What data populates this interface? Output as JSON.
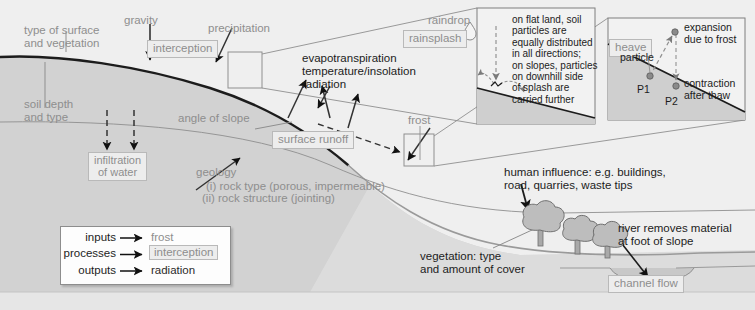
{
  "colors": {
    "sky": "#efefef",
    "ground": "#cfcfcf",
    "ground_light": "#dcdcdc",
    "inset_fill": "#f2f2f2",
    "inset_ground": "#d2d2d2",
    "input_text": "#8e8e8e",
    "output_text": "#2b2b2b",
    "box_border": "#b9b9b9",
    "box_fill": "#ededed",
    "line": "#6e6e6e",
    "slope_line": "#1c1c1c"
  },
  "labels": {
    "type_of_surface": "type of surface\nand vegetation",
    "gravity": "gravity",
    "interception": "interception",
    "precipitation": "precipitation",
    "soil_depth": "soil depth\nand type",
    "infiltration": "infiltration\nof water",
    "angle_of_slope": "angle of slope",
    "evapotranspiration": "evapotranspiration\ntemperature/insolation\nradiation",
    "surface_runoff": "surface runoff",
    "geology": "geology",
    "geology_i": "(i) rock type (porous, impermeable)",
    "geology_ii": "(ii) rock structure (jointing)",
    "frost": "frost",
    "raindrop": "raindrop",
    "rainsplash": "rainsplash",
    "heave": "heave",
    "human_influence": "human influence: e.g. buildings,\nroad, quarries, waste tips",
    "vegetation": "vegetation: type\nand amount of cover",
    "river_removes": "river removes material\nat foot of slope",
    "channel_flow": "channel flow"
  },
  "rainsplash_inset": {
    "note": "on flat land, soil\nparticles are\nequally distributed\nin all directions;\non slopes, particles\non downhill side\nof splash are\ncarried further"
  },
  "frost_inset": {
    "expansion": "expansion\ndue to frost",
    "contraction": "contraction\nafter thaw",
    "particle": "particle",
    "p1": "P1",
    "p2": "P2"
  },
  "legend": {
    "rows": [
      {
        "term": "inputs",
        "example": "frost",
        "style": "input"
      },
      {
        "term": "processes",
        "example": "interception",
        "style": "process"
      },
      {
        "term": "outputs",
        "example": "radiation",
        "style": "output"
      }
    ]
  }
}
